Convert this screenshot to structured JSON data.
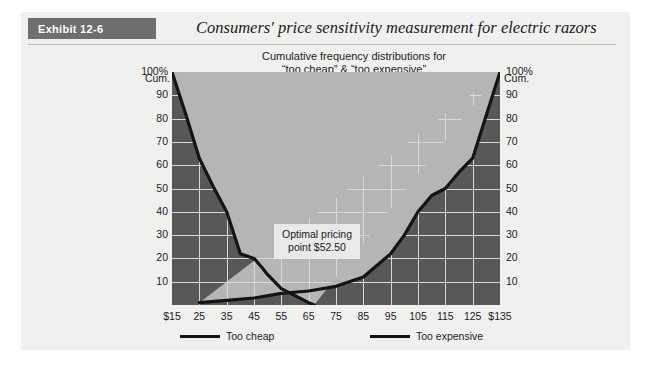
{
  "exhibit": {
    "tag": "Exhibit 12-6",
    "title": "Consumers' price sensitivity measurement for electric razors"
  },
  "chart_data": {
    "type": "line",
    "title": "Cumulative frequency distributions for\n“too cheap” & “too expensive”",
    "title_line1": "Cumulative frequency distributions for",
    "title_line2": "“too cheap” & “too expensive”",
    "xlabel": "",
    "ylabel": "Cum.",
    "ylabel_left_top": "Cum.",
    "ylabel_right_top": "Cum.",
    "xlim": [
      15,
      135
    ],
    "ylim": [
      0,
      100
    ],
    "grid": true,
    "legend_position": "bottom",
    "x_tick_labels": [
      "$15",
      "25",
      "35",
      "45",
      "55",
      "65",
      "75",
      "85",
      "95",
      "105",
      "115",
      "125",
      "$135"
    ],
    "x_ticks": [
      15,
      25,
      35,
      45,
      55,
      65,
      75,
      85,
      95,
      105,
      115,
      125,
      135
    ],
    "y_tick_labels": [
      "100%",
      "90",
      "80",
      "70",
      "60",
      "50",
      "40",
      "30",
      "20",
      "10"
    ],
    "y_ticks": [
      100,
      90,
      80,
      70,
      60,
      50,
      40,
      30,
      20,
      10
    ],
    "series": [
      {
        "name": "Too cheap",
        "color": "#141414",
        "x": [
          15,
          20,
          25,
          30,
          35,
          40,
          45,
          48,
          50,
          55,
          60,
          65,
          67
        ],
        "values": [
          100,
          82,
          63,
          51,
          40,
          22,
          20,
          16,
          13,
          7,
          4,
          1,
          0
        ]
      },
      {
        "name": "Too expensive",
        "color": "#141414",
        "x": [
          25,
          35,
          45,
          55,
          65,
          75,
          85,
          95,
          100,
          105,
          110,
          115,
          120,
          125,
          135
        ],
        "values": [
          1,
          2,
          3,
          5,
          6,
          8,
          12,
          22,
          30,
          40,
          47,
          50,
          57,
          63,
          100
        ]
      }
    ],
    "annotations": [
      {
        "name": "optimal-pricing-point",
        "line1": "Optimal pricing",
        "line2": "point $52.50",
        "x": 52.5,
        "y": 5
      }
    ]
  },
  "legend": {
    "items": [
      {
        "label": "Too cheap"
      },
      {
        "label": "Too expensive"
      }
    ]
  },
  "colors": {
    "fill_area": "#b5b5b5",
    "fill_below": "#585858",
    "line": "#141414",
    "grid": "#d8d8d8",
    "tag_bg": "#6e6e6e",
    "panel_bg": "#f0f0ef"
  }
}
